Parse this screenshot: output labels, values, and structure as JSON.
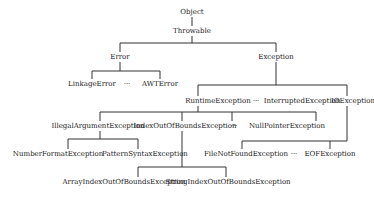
{
  "diagram": {
    "colors": {
      "background": "#ffffff",
      "line": "#333333",
      "text": "#222222"
    },
    "nodes": {
      "object": {
        "label": "Object",
        "x": 192,
        "y": 12
      },
      "throwable": {
        "label": "Throwable",
        "x": 192,
        "y": 31
      },
      "error": {
        "label": "Error",
        "x": 120,
        "y": 57
      },
      "exception": {
        "label": "Exception",
        "x": 276,
        "y": 57
      },
      "linkage_error": {
        "label": "LinkageError",
        "x": 92,
        "y": 84
      },
      "error_ellipsis": {
        "label": "···",
        "x": 127,
        "y": 84
      },
      "awt_error": {
        "label": "AWTError",
        "x": 160,
        "y": 84
      },
      "runtime_exception": {
        "label": "RuntimeException",
        "x": 218,
        "y": 101
      },
      "exception_ellipsis": {
        "label": "···",
        "x": 256,
        "y": 101
      },
      "interrupted_exception": {
        "label": "InterruptedException",
        "x": 302,
        "y": 101
      },
      "io_exception": {
        "label": "IOException",
        "x": 353,
        "y": 101
      },
      "illegal_argument_exception": {
        "label": "IllegalArgumentException",
        "x": 98,
        "y": 126
      },
      "index_out_of_bounds_exception": {
        "label": "IndexOutOfBoundsException",
        "x": 185,
        "y": 126
      },
      "runtime_ellipsis": {
        "label": "···",
        "x": 234,
        "y": 126
      },
      "null_pointer_exception": {
        "label": "NullPointerException",
        "x": 287,
        "y": 126
      },
      "number_format_exception": {
        "label": "NumberFormatException",
        "x": 58,
        "y": 154
      },
      "pattern_syntax_exception": {
        "label": "PatternSyntaxException",
        "x": 145,
        "y": 154
      },
      "file_not_found_exception": {
        "label": "FileNotFoundException",
        "x": 246,
        "y": 154
      },
      "io_ellipsis": {
        "label": "···",
        "x": 294,
        "y": 154
      },
      "eof_exception": {
        "label": "EOFException",
        "x": 330,
        "y": 154
      },
      "array_index_out_of_bounds_exception": {
        "label": "ArrayIndexOutOfBoundsException",
        "x": 124,
        "y": 182
      },
      "string_index_out_of_bounds_exception": {
        "label": "StringIndexOutOfBoundsException",
        "x": 228,
        "y": 182
      }
    },
    "edges": [
      [
        "Object",
        "Throwable"
      ],
      [
        "Throwable",
        "Error"
      ],
      [
        "Throwable",
        "Exception"
      ],
      [
        "Error",
        "LinkageError"
      ],
      [
        "Error",
        "AWTError"
      ],
      [
        "Exception",
        "RuntimeException"
      ],
      [
        "Exception",
        "InterruptedException"
      ],
      [
        "Exception",
        "IOException"
      ],
      [
        "RuntimeException",
        "IllegalArgumentException"
      ],
      [
        "RuntimeException",
        "IndexOutOfBoundsException"
      ],
      [
        "RuntimeException",
        "NullPointerException"
      ],
      [
        "IllegalArgumentException",
        "NumberFormatException"
      ],
      [
        "IllegalArgumentException",
        "PatternSyntaxException"
      ],
      [
        "IndexOutOfBoundsException",
        "ArrayIndexOutOfBoundsException"
      ],
      [
        "IndexOutOfBoundsException",
        "StringIndexOutOfBoundsException"
      ],
      [
        "IOException",
        "FileNotFoundException"
      ],
      [
        "IOException",
        "EOFException"
      ]
    ]
  }
}
